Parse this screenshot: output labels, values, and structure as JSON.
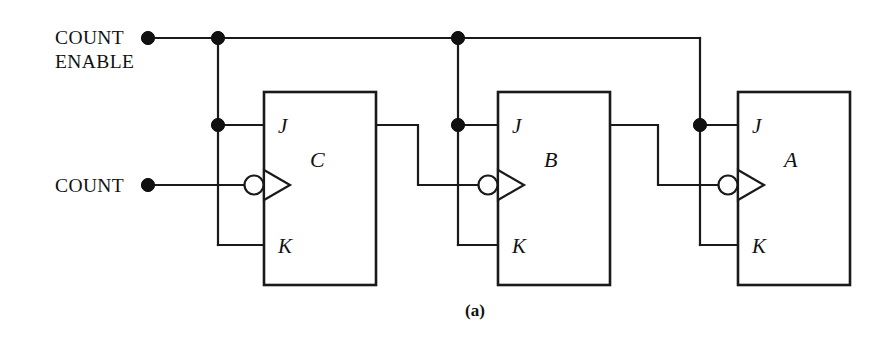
{
  "figure": {
    "caption": "(a)",
    "background_color": "#ffffff",
    "line_color": "#1a1a1a"
  },
  "signals": [
    {
      "id": "count-enable",
      "label_line1": "COUNT",
      "label_line2": "ENABLE"
    },
    {
      "id": "count",
      "label_line1": "COUNT",
      "label_line2": ""
    }
  ],
  "flipflops": [
    {
      "id": "ff-c",
      "name": "C",
      "pin_j": "J",
      "pin_k": "K",
      "x": 264,
      "y": 92,
      "w": 112,
      "h": 193
    },
    {
      "id": "ff-b",
      "name": "B",
      "pin_j": "J",
      "pin_k": "K",
      "x": 498,
      "y": 92,
      "w": 112,
      "h": 193
    },
    {
      "id": "ff-a",
      "name": "A",
      "pin_j": "J",
      "pin_k": "K",
      "x": 738,
      "y": 92,
      "w": 112,
      "h": 193
    }
  ],
  "pin_labels": {
    "j": "J",
    "k": "K"
  },
  "junction_dots": [
    {
      "id": "dot-count-enable-terminal",
      "x": 148,
      "y": 38
    },
    {
      "id": "dot-enable-branch-c",
      "x": 218,
      "y": 38
    },
    {
      "id": "dot-enable-branch-b",
      "x": 458,
      "y": 38
    },
    {
      "id": "dot-j-c",
      "x": 218,
      "y": 125
    },
    {
      "id": "dot-j-b",
      "x": 458,
      "y": 125
    },
    {
      "id": "dot-j-a",
      "x": 700,
      "y": 125
    },
    {
      "id": "dot-count-terminal",
      "x": 148,
      "y": 185
    }
  ],
  "geometry": {
    "rail_y": 38,
    "j_y": 125,
    "clk_y": 185,
    "k_y": 245,
    "enable_rail_x_start": 148,
    "enable_rail_x_end": 700,
    "count_x_start": 148
  }
}
